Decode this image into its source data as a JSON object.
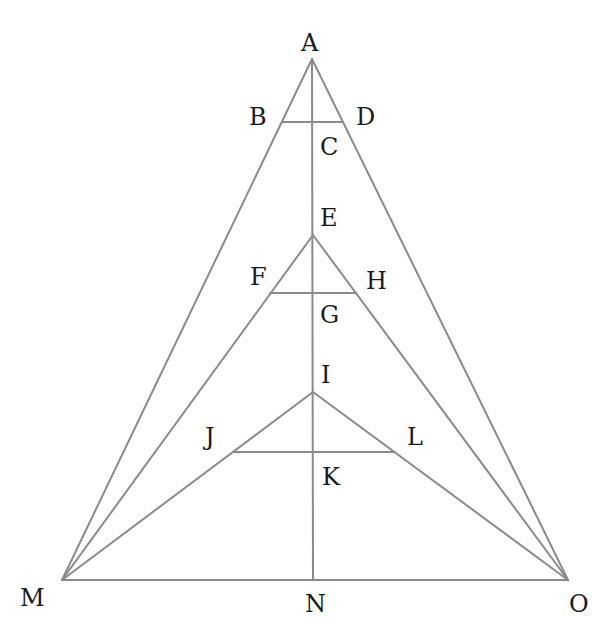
{
  "diagram": {
    "type": "nested-triangles-geometry",
    "colors": {
      "line": "#8a8a8a",
      "label": "#1a1a1a",
      "background": "#ffffff"
    },
    "points": {
      "A": [
        312,
        59
      ],
      "B": [
        282,
        122
      ],
      "C": [
        313,
        122
      ],
      "D": [
        342,
        122
      ],
      "E": [
        313,
        235
      ],
      "F": [
        270,
        293
      ],
      "G": [
        313,
        293
      ],
      "H": [
        356,
        293
      ],
      "I": [
        313,
        392
      ],
      "J": [
        233,
        452
      ],
      "K": [
        313,
        452
      ],
      "L": [
        395,
        452
      ],
      "M": [
        62,
        580
      ],
      "N": [
        313,
        580
      ],
      "O": [
        568,
        580
      ]
    },
    "segments": [
      [
        "A",
        "M"
      ],
      [
        "A",
        "O"
      ],
      [
        "M",
        "O"
      ],
      [
        "A",
        "N"
      ],
      [
        "E",
        "M"
      ],
      [
        "E",
        "O"
      ],
      [
        "I",
        "M"
      ],
      [
        "I",
        "O"
      ],
      [
        "B",
        "D"
      ],
      [
        "F",
        "H"
      ],
      [
        "J",
        "L"
      ]
    ],
    "labels": [
      {
        "text": "A",
        "x": 301,
        "y": 51
      },
      {
        "text": "B",
        "x": 249,
        "y": 125
      },
      {
        "text": "C",
        "x": 320,
        "y": 155
      },
      {
        "text": "D",
        "x": 356,
        "y": 125
      },
      {
        "text": "E",
        "x": 320,
        "y": 226
      },
      {
        "text": "F",
        "x": 250,
        "y": 285
      },
      {
        "text": "G",
        "x": 320,
        "y": 323
      },
      {
        "text": "H",
        "x": 366,
        "y": 289
      },
      {
        "text": "I",
        "x": 321,
        "y": 383
      },
      {
        "text": "J",
        "x": 205,
        "y": 445
      },
      {
        "text": "K",
        "x": 322,
        "y": 485
      },
      {
        "text": "L",
        "x": 407,
        "y": 445
      },
      {
        "text": "M",
        "x": 20,
        "y": 606
      },
      {
        "text": "N",
        "x": 305,
        "y": 612
      },
      {
        "text": "O",
        "x": 569,
        "y": 612
      }
    ]
  }
}
